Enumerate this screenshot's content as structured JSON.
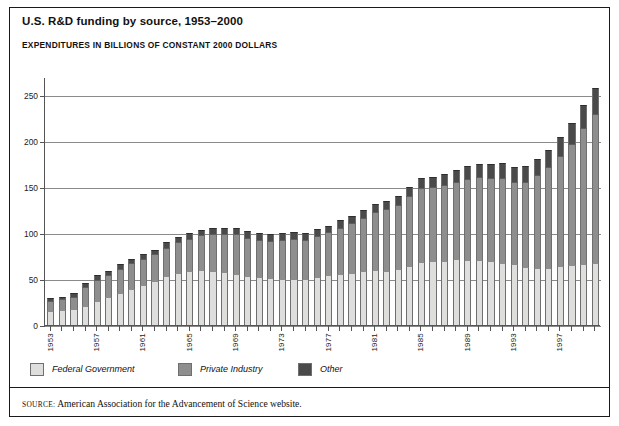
{
  "title": "U.S. R&D funding by source, 1953–2000",
  "subtitle": "EXPENDITURES IN BILLIONS OF CONSTANT 2000 DOLLARS",
  "source": {
    "keyword": "SOURCE:",
    "text": "American Association for the Advancement of Science website."
  },
  "legend": [
    {
      "label": "Federal Government",
      "color": "#dededc",
      "key": "federal"
    },
    {
      "label": "Private Industry",
      "color": "#8e8e8e",
      "key": "private"
    },
    {
      "label": "Other",
      "color": "#4a4a4a",
      "key": "other"
    }
  ],
  "chart_data": {
    "type": "bar",
    "stacked": true,
    "title": "U.S. R&D funding by source, 1953–2000",
    "subtitle": "EXPENDITURES IN BILLIONS OF CONSTANT 2000 DOLLARS",
    "xlabel": "",
    "ylabel": "EXPENDITURES IN BILLIONS OF CONSTANT 2000 DOLLARS",
    "ylim": [
      0,
      270
    ],
    "yticks": [
      0,
      50,
      100,
      150,
      200,
      250
    ],
    "ytick_labels": [
      "0",
      "50",
      "100",
      "150",
      "200",
      "250"
    ],
    "grid": true,
    "legend_position": "below-axis",
    "x": [
      1953,
      1954,
      1955,
      1956,
      1957,
      1958,
      1959,
      1960,
      1961,
      1962,
      1963,
      1964,
      1965,
      1966,
      1967,
      1968,
      1969,
      1970,
      1971,
      1972,
      1973,
      1974,
      1975,
      1976,
      1977,
      1978,
      1979,
      1980,
      1981,
      1982,
      1983,
      1984,
      1985,
      1986,
      1987,
      1988,
      1989,
      1990,
      1991,
      1992,
      1993,
      1994,
      1995,
      1996,
      1997,
      1998,
      1999,
      2000
    ],
    "xtick_labels": [
      "1953",
      "1957",
      "1961",
      "1965",
      "1969",
      "1973",
      "1977",
      "1981",
      "1985",
      "1989",
      "1993",
      "1997"
    ],
    "xtick_years": [
      1953,
      1957,
      1961,
      1965,
      1969,
      1973,
      1977,
      1981,
      1985,
      1989,
      1993,
      1997
    ],
    "series": [
      {
        "name": "Federal Government",
        "color": "#dededc",
        "values": [
          15,
          16,
          17,
          21,
          26,
          30,
          35,
          39,
          44,
          48,
          53,
          57,
          59,
          60,
          59,
          58,
          56,
          53,
          52,
          51,
          50,
          50,
          50,
          52,
          54,
          56,
          57,
          59,
          60,
          59,
          61,
          64,
          69,
          70,
          70,
          72,
          71,
          71,
          70,
          68,
          66,
          63,
          62,
          62,
          64,
          65,
          66,
          67
        ]
      },
      {
        "name": "Private Industry",
        "color": "#8e8e8e",
        "values": [
          11,
          12,
          14,
          20,
          23,
          24,
          26,
          28,
          28,
          29,
          31,
          33,
          35,
          38,
          40,
          41,
          43,
          42,
          41,
          41,
          43,
          44,
          43,
          45,
          47,
          50,
          54,
          58,
          63,
          67,
          70,
          76,
          80,
          80,
          82,
          84,
          88,
          90,
          90,
          92,
          90,
          93,
          101,
          110,
          120,
          132,
          148,
          163
        ]
      },
      {
        "name": "Other",
        "color": "#4a4a4a",
        "values": [
          3,
          3,
          4,
          5,
          5,
          5,
          5,
          5,
          5,
          5,
          6,
          6,
          6,
          6,
          7,
          7,
          7,
          7,
          7,
          7,
          7,
          7,
          7,
          7,
          7,
          8,
          8,
          8,
          9,
          9,
          10,
          10,
          11,
          11,
          12,
          13,
          14,
          14,
          15,
          16,
          16,
          17,
          18,
          19,
          21,
          23,
          26,
          28
        ]
      }
    ],
    "totals": [
      29,
      31,
      35,
      46,
      54,
      59,
      66,
      72,
      77,
      82,
      90,
      96,
      100,
      104,
      106,
      106,
      106,
      102,
      100,
      99,
      100,
      101,
      100,
      104,
      108,
      114,
      119,
      125,
      132,
      135,
      141,
      150,
      160,
      161,
      164,
      169,
      173,
      175,
      175,
      176,
      172,
      173,
      181,
      191,
      205,
      220,
      240,
      258
    ]
  }
}
